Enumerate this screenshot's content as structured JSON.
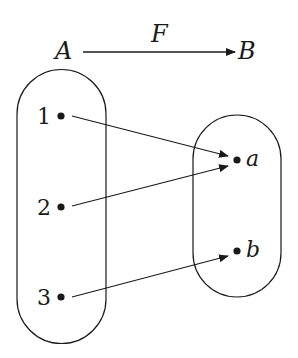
{
  "diagram": {
    "title_arrow": {
      "from": "A",
      "to": "B",
      "label": "F"
    },
    "sets": [
      {
        "name": "A",
        "elements": [
          "1",
          "2",
          "3"
        ]
      },
      {
        "name": "B",
        "elements": [
          "a",
          "b"
        ]
      }
    ],
    "mappings": [
      {
        "from": "1",
        "to": "a"
      },
      {
        "from": "2",
        "to": "a"
      },
      {
        "from": "3",
        "to": "b"
      }
    ],
    "colors": {
      "stroke": "#1a1a1a",
      "background": "#ffffff"
    }
  }
}
